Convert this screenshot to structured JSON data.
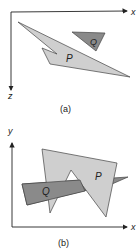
{
  "figure_a": {
    "caption": "(a)",
    "axis_h_label": "x",
    "axis_v_label": "z",
    "polygon_p_label": "P",
    "polygon_q_label": "Q"
  },
  "figure_b": {
    "caption": "(b)",
    "axis_h_label": "x",
    "axis_v_label": "y",
    "polygon_p_label": "P",
    "polygon_q_label": "Q"
  },
  "colors": {
    "p_fill": "#cfcfcf",
    "q_fill": "#8a8a8a",
    "stroke": "#444444",
    "axis": "#222222"
  }
}
